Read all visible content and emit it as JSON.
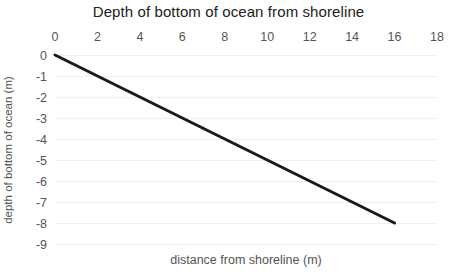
{
  "chart_data": {
    "type": "line",
    "title": "Depth of bottom of ocean from shoreline",
    "xlabel": "distance from shoreline (m)",
    "ylabel": "depth of bottom of ocean (m)",
    "x_axis_position": "top",
    "x_ticks": [
      0,
      2,
      4,
      6,
      8,
      10,
      12,
      14,
      16,
      18
    ],
    "y_ticks": [
      0,
      -1,
      -2,
      -3,
      -4,
      -5,
      -6,
      -7,
      -8,
      -9
    ],
    "xlim": [
      0,
      18
    ],
    "ylim": [
      -9,
      0
    ],
    "grid": "horizontal",
    "legend": "none",
    "series": [
      {
        "name": "ocean depth profile",
        "points": [
          {
            "x": 0,
            "y": 0
          },
          {
            "x": 16,
            "y": -8
          }
        ],
        "color": "#1a1a1a",
        "stroke_width": 3
      }
    ],
    "colors": {
      "title": "#212121",
      "tick_label": "#555555",
      "axis_label": "#555555",
      "gridline": "#efefef",
      "background": "#ffffff"
    }
  }
}
